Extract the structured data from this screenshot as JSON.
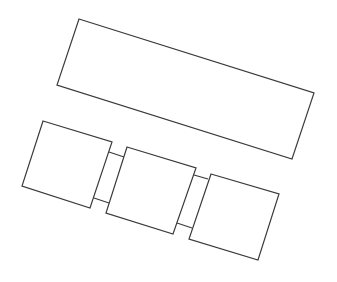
{
  "diagram": {
    "width": 337,
    "height": 282,
    "stroke_color": "#3a3a3a",
    "background": "#ffffff",
    "shapes": [
      {
        "name": "large-rectangle",
        "points": "79,19 314,93 292,159 57,85"
      },
      {
        "name": "square-1",
        "points": "43,121 112,142 90,208 22,186"
      },
      {
        "name": "square-2",
        "points": "127,147 196,168 173,234 106,213"
      },
      {
        "name": "square-3",
        "points": "211,174 279,194 258,260 189,239"
      }
    ],
    "connectors": [
      {
        "name": "connector-1-top",
        "x1": 109,
        "y1": 152,
        "x2": 124,
        "y2": 157
      },
      {
        "name": "connector-1-bottom",
        "x1": 94,
        "y1": 198,
        "x2": 109,
        "y2": 203
      },
      {
        "name": "connector-2-top",
        "x1": 194,
        "y1": 175,
        "x2": 208,
        "y2": 179
      },
      {
        "name": "connector-2-bottom",
        "x1": 177,
        "y1": 223,
        "x2": 192,
        "y2": 228
      }
    ]
  }
}
